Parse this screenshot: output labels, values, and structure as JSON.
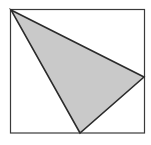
{
  "figure": {
    "title": "",
    "canvas": {
      "width": 151,
      "height": 145,
      "background": "#ffffff"
    },
    "frame": {
      "name": "bounding-box",
      "x": 10.5,
      "y": 9.5,
      "width": 134,
      "height": 123.5,
      "stroke": "#3a3a3a",
      "stroke_width": 1.2,
      "fill": "#ffffff"
    },
    "shapes": [
      {
        "name": "triangle",
        "type": "polygon",
        "points": "11,10 144,77 80,133",
        "vertices": [
          {
            "label": "top-left-vertex",
            "x": 11,
            "y": 10
          },
          {
            "label": "right-vertex",
            "x": 144,
            "y": 77
          },
          {
            "label": "bottom-vertex",
            "x": 80,
            "y": 133
          }
        ],
        "fill": "#c9c9c9",
        "stroke": "#2b2b2b",
        "stroke_width": 1.6
      }
    ]
  }
}
